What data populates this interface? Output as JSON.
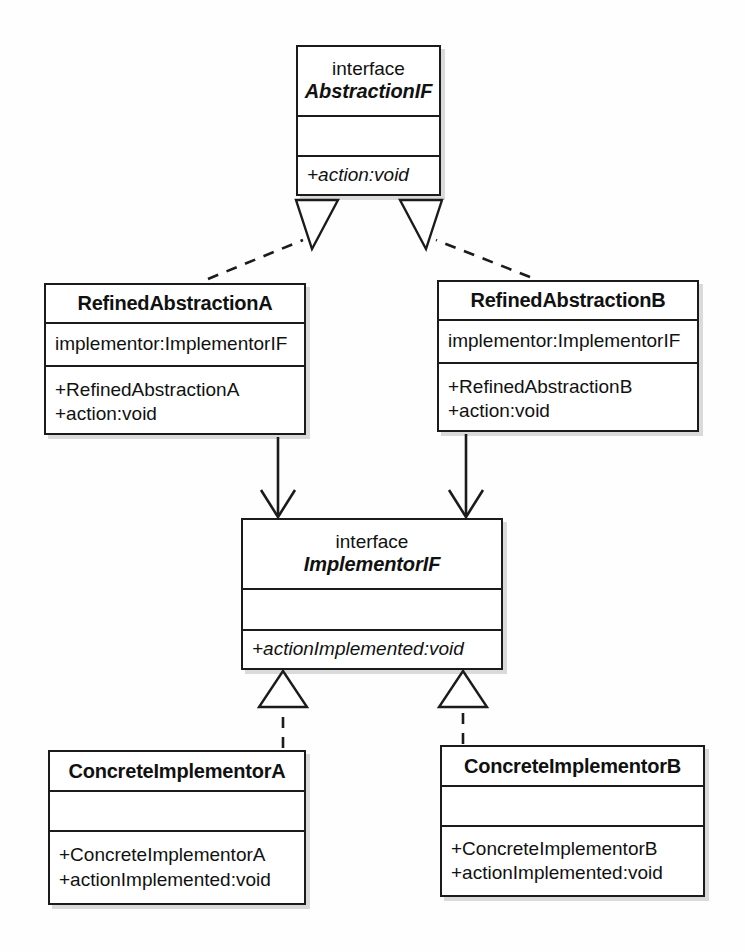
{
  "diagram": {
    "notation": "UML",
    "background_color": "#fefefe",
    "line_color": "#1b1b1b"
  },
  "classes": {
    "abstraction_if": {
      "stereotype": "interface",
      "name": "AbstractionIF",
      "is_interface": true,
      "attributes": [],
      "operations": [
        "+action:void"
      ]
    },
    "refined_abstraction_a": {
      "stereotype": "",
      "name": "RefinedAbstractionA",
      "is_interface": false,
      "attributes": [
        "implementor:ImplementorIF"
      ],
      "operations": [
        "+RefinedAbstractionA",
        "+action:void"
      ]
    },
    "refined_abstraction_b": {
      "stereotype": "",
      "name": "RefinedAbstractionB",
      "is_interface": false,
      "attributes": [
        "implementor:ImplementorIF"
      ],
      "operations": [
        "+RefinedAbstractionB",
        "+action:void"
      ]
    },
    "implementor_if": {
      "stereotype": "interface",
      "name": "ImplementorIF",
      "is_interface": true,
      "attributes": [],
      "operations": [
        "+actionImplemented:void"
      ]
    },
    "concrete_implementor_a": {
      "stereotype": "",
      "name": "ConcreteImplementorA",
      "is_interface": false,
      "attributes": [],
      "operations": [
        "+ConcreteImplementorA",
        "+actionImplemented:void"
      ]
    },
    "concrete_implementor_b": {
      "stereotype": "",
      "name": "ConcreteImplementorB",
      "is_interface": false,
      "attributes": [],
      "operations": [
        "+ConcreteImplementorB",
        "+actionImplemented:void"
      ]
    }
  },
  "relationships": [
    {
      "id": "rel-refa-realizes-abstractionif",
      "from": "RefinedAbstractionA",
      "to": "AbstractionIF",
      "type": "realization",
      "line_style": "dashed",
      "arrowhead": "hollow-triangle"
    },
    {
      "id": "rel-refb-realizes-abstractionif",
      "from": "RefinedAbstractionB",
      "to": "AbstractionIF",
      "type": "realization",
      "line_style": "dashed",
      "arrowhead": "hollow-triangle"
    },
    {
      "id": "rel-refa-uses-implementorif",
      "from": "RefinedAbstractionA",
      "to": "ImplementorIF",
      "type": "association",
      "line_style": "solid",
      "arrowhead": "open-arrow"
    },
    {
      "id": "rel-refb-uses-implementorif",
      "from": "RefinedAbstractionB",
      "to": "ImplementorIF",
      "type": "association",
      "line_style": "solid",
      "arrowhead": "open-arrow"
    },
    {
      "id": "rel-cia-realizes-implementorif",
      "from": "ConcreteImplementorA",
      "to": "ImplementorIF",
      "type": "realization",
      "line_style": "dashed",
      "arrowhead": "hollow-triangle"
    },
    {
      "id": "rel-cib-realizes-implementorif",
      "from": "ConcreteImplementorB",
      "to": "ImplementorIF",
      "type": "realization",
      "line_style": "dashed",
      "arrowhead": "hollow-triangle"
    }
  ]
}
